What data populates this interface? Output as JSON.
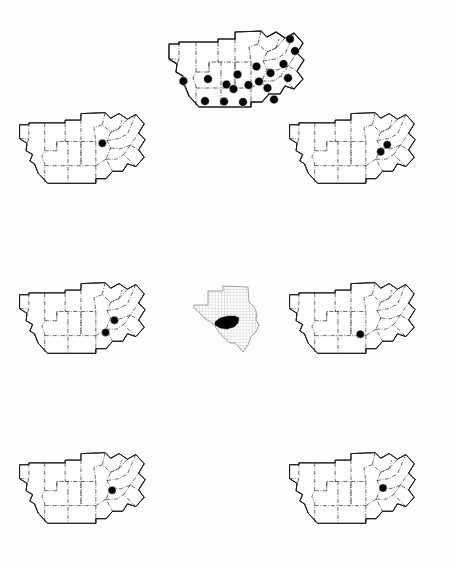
{
  "figure": {
    "title": "",
    "caption": "",
    "background_color": "#ffffff",
    "ink_color": "#1a1a1a",
    "dot_color": "#000000",
    "width": 456,
    "height": 563,
    "kind": "distribution-map-plate",
    "region_name": "Edwards Plateau, Texas",
    "panel_count": 7,
    "inset_label": "Texas locator inset"
  },
  "legend": {
    "symbol_name": "filled-circle",
    "symbol_meaning": "occurrence record",
    "boundary_style_outer": "solid",
    "boundary_style_county": "dash-dot"
  },
  "inset": {
    "name": "texas-state-inset",
    "state": "Texas",
    "highlight_color": "#000000",
    "stipple_color": "#8a8a8a",
    "x": 190,
    "y": 283,
    "w": 78,
    "h": 76
  },
  "panels": [
    {
      "id": "panel-top-center",
      "name": "map-panel-1",
      "position": "top-center",
      "x": 163,
      "y": 26,
      "w": 160,
      "h": 100,
      "scale": 1.0,
      "dot_count": 18,
      "dots": [
        {
          "x": 20.5,
          "y": 55.0
        },
        {
          "x": 45.0,
          "y": 53.0
        },
        {
          "x": 63.5,
          "y": 58.5
        },
        {
          "x": 74.5,
          "y": 48.5
        },
        {
          "x": 85.5,
          "y": 59.0
        },
        {
          "x": 42.0,
          "y": 75.0
        },
        {
          "x": 61.0,
          "y": 75.5
        },
        {
          "x": 80.0,
          "y": 76.0
        },
        {
          "x": 93.5,
          "y": 40.5
        },
        {
          "x": 107.5,
          "y": 47.0
        },
        {
          "x": 104.5,
          "y": 62.0
        },
        {
          "x": 111.0,
          "y": 73.5
        },
        {
          "x": 120.5,
          "y": 38.0
        },
        {
          "x": 125.0,
          "y": 52.0
        },
        {
          "x": 132.0,
          "y": 25.0
        },
        {
          "x": 127.0,
          "y": 13.0
        },
        {
          "x": 96.0,
          "y": 55.5
        },
        {
          "x": 70.5,
          "y": 63.0
        }
      ]
    },
    {
      "id": "panel-row2-left",
      "name": "map-panel-2",
      "position": "row2-left",
      "x": 14,
      "y": 108,
      "w": 150,
      "h": 95,
      "scale": 0.93,
      "dot_count": 1,
      "dots": [
        {
          "x": 95.0,
          "y": 38.0
        }
      ]
    },
    {
      "id": "panel-row2-right",
      "name": "map-panel-3",
      "position": "row2-right",
      "x": 284,
      "y": 108,
      "w": 150,
      "h": 95,
      "scale": 0.93,
      "dot_count": 2,
      "dots": [
        {
          "x": 111.0,
          "y": 39.5
        },
        {
          "x": 104.0,
          "y": 47.0
        }
      ]
    },
    {
      "id": "panel-row3-left",
      "name": "map-panel-4",
      "position": "row3-left",
      "x": 14,
      "y": 278,
      "w": 150,
      "h": 95,
      "scale": 0.93,
      "dot_count": 2,
      "dots": [
        {
          "x": 108.0,
          "y": 45.5
        },
        {
          "x": 98.5,
          "y": 58.5
        }
      ]
    },
    {
      "id": "panel-row3-right",
      "name": "map-panel-5",
      "position": "row3-right",
      "x": 284,
      "y": 278,
      "w": 150,
      "h": 95,
      "scale": 0.93,
      "dot_count": 1,
      "dots": [
        {
          "x": 82.0,
          "y": 60.5
        }
      ]
    },
    {
      "id": "panel-row4-left",
      "name": "map-panel-6",
      "position": "row4-left",
      "x": 14,
      "y": 448,
      "w": 150,
      "h": 95,
      "scale": 0.93,
      "dot_count": 1,
      "dots": [
        {
          "x": 105.5,
          "y": 45.5
        }
      ]
    },
    {
      "id": "panel-row4-right",
      "name": "map-panel-7",
      "position": "row4-right",
      "x": 284,
      "y": 448,
      "w": 150,
      "h": 95,
      "scale": 0.93,
      "dot_count": 1,
      "dots": [
        {
          "x": 106.5,
          "y": 43.0
        }
      ]
    }
  ],
  "geometry": {
    "outline": "M 6,33 L 6,18 L 16,18 L 16,16 L 55,16 L 55,13 L 72,13 L 72,6 L 98,5 L 104,11 L 113,6 L 122,12 L 131,7 L 140,17 L 134,27 L 141,34 L 134,45 L 140,53 L 131,63 L 122,60 L 117,68 L 106,68 L 99,76 L 88,76 L 88,81 L 36,81 L 26,70 L 22,60 L 17,57 L 20,50 L 13,46 L 14,38 Z",
    "county_lines": [
      "M 6,33 L 16,33",
      "M 16,16 L 16,33 L 14,38 L 13,46 L 20,50 L 17,57 L 22,60 L 26,70",
      "M 33,16 L 33,46 L 30,52 L 33,60 L 33,81",
      "M 33,46 L 46,46 L 46,36 L 58,36 L 58,46",
      "M 46,36 L 46,46",
      "M 55,16 L 55,36",
      "M 58,46 L 58,62 L 58,81",
      "M 33,62 L 88,62",
      "M 72,13 L 72,36 L 72,62",
      "M 55,36 L 88,36",
      "M 88,36 L 88,62 L 88,76",
      "M 72,36 L 72,62",
      "M 98,5 L 95,18 L 104,26 L 100,35 L 104,43 L 99,55 L 106,68",
      "M 95,18 L 86,21 L 88,36",
      "M 104,26 L 113,22 L 116,13",
      "M 100,35 L 112,33 L 122,28",
      "M 104,43 L 114,44 L 125,40",
      "M 99,55 L 110,55 L 118,50",
      "M 88,62 L 99,55",
      "M 104,11 L 113,6",
      "M 113,22 L 104,26",
      "M 122,12 L 113,22",
      "M 131,7 L 122,28",
      "M 140,17 L 134,27 L 125,40",
      "M 134,27 L 141,34",
      "M 141,34 L 134,45 L 125,40",
      "M 134,45 L 140,53 L 131,63",
      "M 131,63 L 118,50",
      "M 125,40 L 118,50",
      "M 122,60 L 117,68",
      "M 106,68 L 99,76 L 88,76",
      "M 88,76 L 88,81"
    ]
  }
}
